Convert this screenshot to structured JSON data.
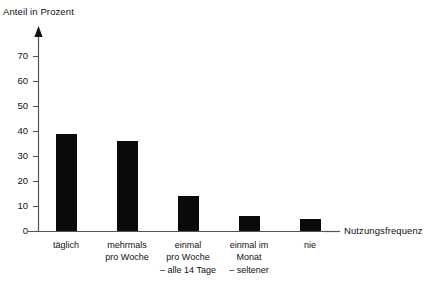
{
  "chart_data": {
    "type": "bar",
    "title": "",
    "xlabel": "Nutzungsfrequenz",
    "ylabel": "Anteil in Prozent",
    "categories": [
      "täglich",
      "mehrmals\npro Woche",
      "einmal\npro Woche\n– alle 14 Tage",
      "einmal im\nMonat\n– seltener",
      "nie"
    ],
    "category_lines": [
      [
        "täglich"
      ],
      [
        "mehrmals",
        "pro Woche"
      ],
      [
        "einmal",
        "pro Woche",
        "– alle 14 Tage"
      ],
      [
        "einmal im",
        "Monat",
        "– seltener"
      ],
      [
        "nie"
      ]
    ],
    "values": [
      39,
      36,
      14,
      6,
      5
    ],
    "ylim": [
      0,
      70
    ],
    "yticks": [
      0,
      10,
      20,
      30,
      40,
      50,
      60,
      70
    ],
    "ytick_labels": [
      "0",
      "10",
      "20",
      "30",
      "40",
      "50",
      "60",
      "70"
    ],
    "grid": false,
    "legend": null,
    "bar_color": "#0a0a0a",
    "axis_color": "#555555"
  },
  "axes": {
    "y_title": "Anteil in Prozent",
    "x_title": "Nutzungsfrequenz"
  }
}
